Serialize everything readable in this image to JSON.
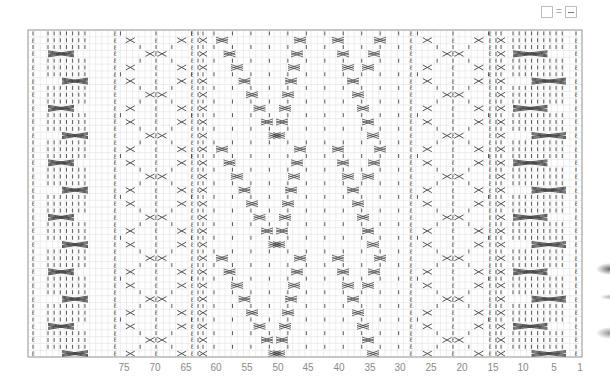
{
  "legend": {
    "items": [
      {
        "symbol": "empty-square",
        "equals": "=",
        "meaning": "purl-dash-square"
      }
    ],
    "equals_sign": "="
  },
  "chart": {
    "grid": {
      "left": 28,
      "top": 30,
      "right": 582,
      "bottom": 357,
      "columns": 90,
      "rows": 48,
      "line_color": "#e2e2e2",
      "border_color": "#9a9a9a",
      "symbol_color": "#444444"
    },
    "column_labels": [
      {
        "label": "75",
        "x": 124
      },
      {
        "label": "70",
        "x": 155
      },
      {
        "label": "65",
        "x": 186
      },
      {
        "label": "60",
        "x": 216
      },
      {
        "label": "55",
        "x": 247
      },
      {
        "label": "50",
        "x": 278
      },
      {
        "label": "45",
        "x": 308
      },
      {
        "label": "40",
        "x": 339
      },
      {
        "label": "35",
        "x": 370
      },
      {
        "label": "30",
        "x": 400
      },
      {
        "label": "25",
        "x": 431
      },
      {
        "label": "20",
        "x": 462
      },
      {
        "label": "15",
        "x": 493
      },
      {
        "label": "10",
        "x": 523
      },
      {
        "label": "5",
        "x": 554
      },
      {
        "label": "1",
        "x": 580
      }
    ],
    "panels": {
      "left_edge_col_x": 33,
      "right_edge_col_x": 576,
      "left_cable_panel": {
        "x0": 48,
        "x1": 88
      },
      "right_cable_panel": {
        "x0": 513,
        "x1": 566
      },
      "left_twist_panel": {
        "x0": 112,
        "x1": 200
      },
      "right_twist_panel": {
        "x0": 408,
        "x1": 498
      },
      "center_panel": {
        "x0": 208,
        "x1": 400
      }
    }
  }
}
